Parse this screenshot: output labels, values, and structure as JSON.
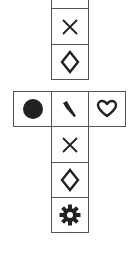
{
  "diagram": {
    "top_column": [
      {
        "symbol": "blank",
        "icon": "empty-icon"
      },
      {
        "symbol": "cross",
        "icon": "x-icon"
      },
      {
        "symbol": "diamond",
        "icon": "diamond-icon"
      }
    ],
    "middle_row": [
      {
        "symbol": "filled circle",
        "icon": "circle-icon"
      },
      {
        "symbol": "feather",
        "icon": "feather-icon"
      },
      {
        "symbol": "heart",
        "icon": "heart-icon"
      }
    ],
    "bottom_column": [
      {
        "symbol": "cross",
        "icon": "x-icon"
      },
      {
        "symbol": "diamond",
        "icon": "diamond-icon"
      },
      {
        "symbol": "gear",
        "icon": "gear-icon"
      }
    ],
    "colors": {
      "stroke": "#222222",
      "border": "#555555",
      "background": "#ffffff"
    }
  }
}
